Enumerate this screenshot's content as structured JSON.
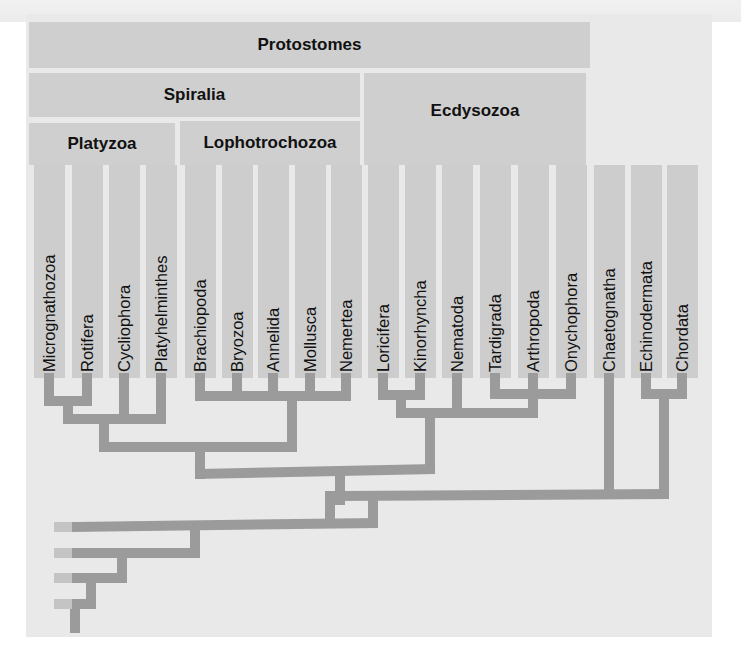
{
  "diagram": {
    "type": "phylogenetic-tree",
    "clades": [
      {
        "id": "protostomes",
        "label": "Protostomes",
        "x": 29,
        "y": 22,
        "w": 561,
        "h": 46
      },
      {
        "id": "spiralia",
        "label": "Spiralia",
        "x": 29,
        "y": 73,
        "w": 331,
        "h": 44
      },
      {
        "id": "ecdysozoa",
        "label": "Ecdysozoa",
        "x": 364,
        "y": 73,
        "w": 222,
        "h": 92
      },
      {
        "id": "platyzoa",
        "label": "Platyzoa",
        "x": 29,
        "y": 123,
        "w": 146,
        "h": 42
      },
      {
        "id": "lophotrochozoa",
        "label": "Lophotrochozoa",
        "x": 180,
        "y": 121,
        "w": 180,
        "h": 44
      }
    ],
    "taxa": [
      {
        "label": "Micrognathozoa",
        "x": 49
      },
      {
        "label": "Rotifera",
        "x": 87
      },
      {
        "label": "Cycliophora",
        "x": 124
      },
      {
        "label": "Platyhelminthes",
        "x": 161
      },
      {
        "label": "Brachiopoda",
        "x": 200
      },
      {
        "label": "Bryozoa",
        "x": 237
      },
      {
        "label": "Annelida",
        "x": 273
      },
      {
        "label": "Mollusca",
        "x": 310
      },
      {
        "label": "Nemertea",
        "x": 346
      },
      {
        "label": "Loricifera",
        "x": 383
      },
      {
        "label": "Kinorhyncha",
        "x": 420
      },
      {
        "label": "Nematoda",
        "x": 457
      },
      {
        "label": "Tardigrada",
        "x": 495
      },
      {
        "label": "Arthropoda",
        "x": 533
      },
      {
        "label": "Onychophora",
        "x": 571
      },
      {
        "label": "Chaetognatha",
        "x": 609
      },
      {
        "label": "Echinodermata",
        "x": 646
      },
      {
        "label": "Chordata",
        "x": 682
      }
    ],
    "branch_color": "#9b9b9b",
    "outgroup_tip_color": "#c4c4c4",
    "branches": [
      [
        49,
        378,
        49,
        401
      ],
      [
        87,
        378,
        87,
        401
      ],
      [
        49,
        401,
        87,
        401
      ],
      [
        68,
        401,
        68,
        419
      ],
      [
        124,
        378,
        124,
        419
      ],
      [
        161,
        378,
        161,
        419
      ],
      [
        68,
        419,
        161,
        419
      ],
      [
        104,
        419,
        104,
        447
      ],
      [
        200,
        378,
        200,
        396
      ],
      [
        237,
        378,
        237,
        396
      ],
      [
        273,
        378,
        273,
        396
      ],
      [
        310,
        378,
        310,
        396
      ],
      [
        346,
        378,
        346,
        396
      ],
      [
        200,
        396,
        346,
        396
      ],
      [
        292,
        396,
        292,
        447
      ],
      [
        104,
        447,
        292,
        447
      ],
      [
        200,
        447,
        200,
        474
      ],
      [
        383,
        378,
        383,
        395
      ],
      [
        420,
        378,
        420,
        395
      ],
      [
        383,
        395,
        420,
        395
      ],
      [
        401,
        395,
        401,
        413
      ],
      [
        457,
        378,
        457,
        413
      ],
      [
        495,
        378,
        495,
        394
      ],
      [
        571,
        378,
        571,
        394
      ],
      [
        495,
        394,
        571,
        394
      ],
      [
        533,
        378,
        533,
        413
      ],
      [
        401,
        413,
        533,
        413
      ],
      [
        430,
        413,
        430,
        469
      ],
      [
        200,
        474,
        430,
        469
      ],
      [
        609,
        378,
        609,
        494
      ],
      [
        646,
        378,
        646,
        394
      ],
      [
        682,
        378,
        682,
        394
      ],
      [
        646,
        394,
        682,
        394
      ],
      [
        664,
        394,
        664,
        494
      ],
      [
        340,
        496,
        664,
        494
      ],
      [
        340,
        474,
        340,
        496
      ],
      [
        340,
        496,
        340,
        500
      ],
      [
        330,
        496,
        330,
        523
      ],
      [
        373,
        496,
        373,
        523
      ],
      [
        75,
        527,
        373,
        523
      ],
      [
        195,
        527,
        195,
        553
      ],
      [
        75,
        553,
        195,
        553
      ],
      [
        122,
        553,
        122,
        578
      ],
      [
        75,
        578,
        122,
        578
      ],
      [
        91,
        578,
        91,
        604
      ],
      [
        75,
        604,
        91,
        604
      ],
      [
        75,
        604,
        75,
        628
      ]
    ],
    "outgroup_tips": [
      {
        "y": 527
      },
      {
        "y": 553
      },
      {
        "y": 578
      },
      {
        "y": 604
      }
    ]
  }
}
